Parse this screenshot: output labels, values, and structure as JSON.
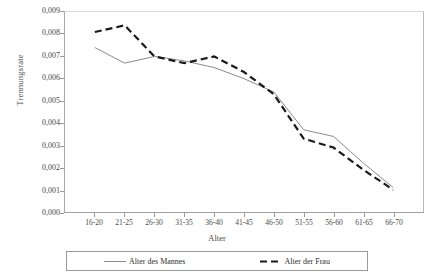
{
  "chart_data": {
    "type": "line",
    "title": "",
    "xlabel": "Alter",
    "ylabel": "Trennungsrate",
    "categories": [
      "16-20",
      "21-25",
      "26-30",
      "31-35",
      "36-40",
      "41-45",
      "46-50",
      "51-55",
      "56-60",
      "61-65",
      "66-70"
    ],
    "ylim": [
      0.0,
      0.009
    ],
    "yticks": [
      "0,000",
      "0,001",
      "0,002",
      "0,003",
      "0,004",
      "0,005",
      "0,006",
      "0,007",
      "0,008",
      "0,009"
    ],
    "ytick_values": [
      0.0,
      0.001,
      0.002,
      0.003,
      0.004,
      0.005,
      0.006,
      0.007,
      0.008,
      0.009
    ],
    "grid": false,
    "legend_position": "bottom",
    "series": [
      {
        "name": "Alter des Mannes",
        "style": "solid",
        "color": "#8a8a8a",
        "values": [
          0.0074,
          0.0067,
          0.007,
          0.0068,
          0.0065,
          0.006,
          0.0054,
          0.0037,
          0.0034,
          0.0022,
          0.0011
        ]
      },
      {
        "name": "Alter der Frau",
        "style": "dashed",
        "color": "#1a1a1a",
        "values": [
          0.0081,
          0.0084,
          0.007,
          0.0067,
          0.007,
          0.0063,
          0.0053,
          0.0033,
          0.0029,
          0.0019,
          0.001
        ]
      }
    ]
  },
  "axes": {
    "y_label": "Trennungsrate",
    "x_label": "Alter"
  },
  "legend": {
    "items": [
      {
        "label": "Alter des Mannes",
        "style": "solid"
      },
      {
        "label": "Alter der Frau",
        "style": "dashed"
      }
    ]
  }
}
